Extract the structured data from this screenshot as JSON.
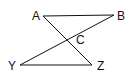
{
  "diagram": {
    "type": "geometry",
    "points": [
      {
        "id": "A",
        "label": "A",
        "x": 43,
        "y": 16,
        "lx": 32,
        "ly": 20
      },
      {
        "id": "B",
        "label": "B",
        "x": 114,
        "y": 15,
        "lx": 117,
        "ly": 20
      },
      {
        "id": "C",
        "label": "C",
        "x": 67,
        "y": 40,
        "lx": 76,
        "ly": 44
      },
      {
        "id": "Y",
        "label": "Y",
        "x": 20,
        "y": 65,
        "lx": 8,
        "ly": 70
      },
      {
        "id": "Z",
        "label": "Z",
        "x": 92,
        "y": 65,
        "lx": 97,
        "ly": 70
      }
    ],
    "segments": [
      {
        "from": "A",
        "to": "B"
      },
      {
        "from": "Y",
        "to": "Z"
      },
      {
        "from": "A",
        "to": "Z"
      },
      {
        "from": "B",
        "to": "Y"
      }
    ],
    "line_color": "#111111"
  }
}
